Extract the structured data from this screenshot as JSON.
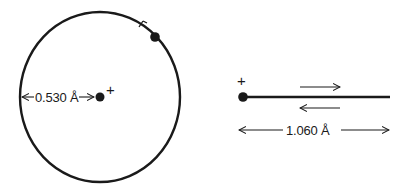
{
  "diagram": {
    "colors": {
      "ink": "#1a1a1a",
      "background": "#ffffff"
    },
    "circular_model": {
      "radius_label": "0.530 Å",
      "nucleus_charge": "+",
      "orbit": {
        "cx": 100,
        "cy": 97,
        "rx": 80,
        "ry": 85
      },
      "electron": {
        "x": 155,
        "y": 36
      },
      "direction_marker": "tick arrow on orbit near electron"
    },
    "linear_model": {
      "length_label": "1.060 Å",
      "nucleus_charge": "+",
      "oscillation_arrows": [
        "right",
        "left"
      ]
    }
  }
}
